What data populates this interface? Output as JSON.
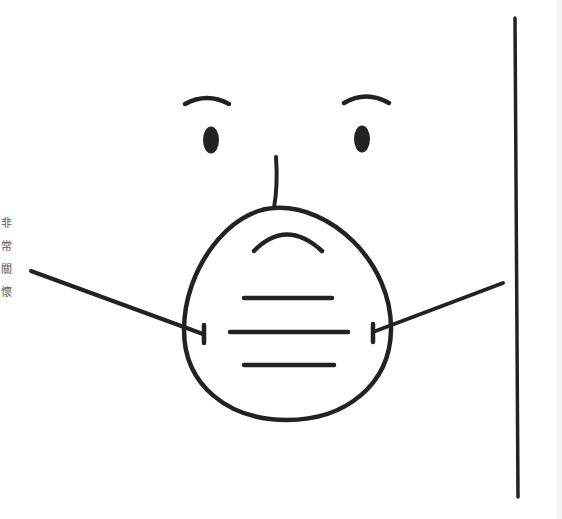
{
  "illustration": {
    "subject": "face wearing a dust mask (respirator) beside a vertical line",
    "stroke_color": "#222222",
    "background_color": "#ffffff",
    "edge_strip_color": "#f3f3f3",
    "icons": [
      "eyebrow-left-icon",
      "eyebrow-right-icon",
      "eye-left-icon",
      "eye-right-icon",
      "nose-icon",
      "dust-mask-icon",
      "mask-strap-left-icon",
      "mask-strap-right-icon",
      "vertical-divider"
    ]
  },
  "side_caption": {
    "chars": [
      "非",
      "常",
      "關",
      "懷"
    ]
  }
}
